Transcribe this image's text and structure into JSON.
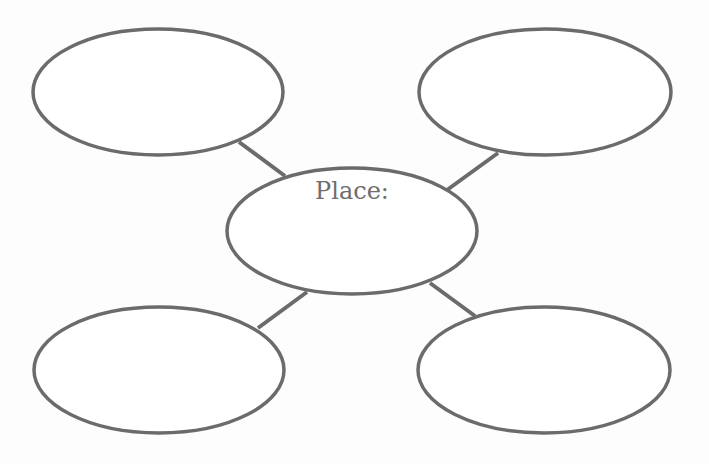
{
  "diagram": {
    "type": "bubble-map",
    "center": {
      "label": "Place:",
      "cx": 352,
      "cy": 231,
      "rx": 125,
      "ry": 63
    },
    "outer_bubbles": [
      {
        "position": "top-left",
        "cx": 158,
        "cy": 92,
        "rx": 125,
        "ry": 63,
        "label": ""
      },
      {
        "position": "top-right",
        "cx": 545,
        "cy": 92,
        "rx": 126,
        "ry": 63,
        "label": ""
      },
      {
        "position": "bottom-left",
        "cx": 159,
        "cy": 370,
        "rx": 125,
        "ry": 63,
        "label": ""
      },
      {
        "position": "bottom-right",
        "cx": 544,
        "cy": 370,
        "rx": 126,
        "ry": 63,
        "label": ""
      }
    ],
    "connectors": [
      {
        "from": "top-left",
        "x1": 239,
        "y1": 142,
        "x2": 285,
        "y2": 176
      },
      {
        "from": "top-right",
        "x1": 498,
        "y1": 153,
        "x2": 447,
        "y2": 190
      },
      {
        "from": "bottom-left",
        "x1": 258,
        "y1": 328,
        "x2": 307,
        "y2": 292
      },
      {
        "from": "bottom-right",
        "x1": 475,
        "y1": 316,
        "x2": 430,
        "y2": 283
      }
    ],
    "colors": {
      "stroke": "#6b6b6b",
      "text": "#6e6e6e",
      "background": "#fdfdfd"
    }
  }
}
